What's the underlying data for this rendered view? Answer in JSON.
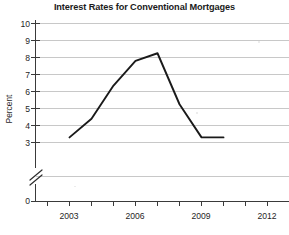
{
  "chart_data": {
    "type": "line",
    "title": "Interest Rates for Conventional Mortgages",
    "xlabel": "",
    "ylabel": "Percent",
    "x": [
      2003,
      2004,
      2005,
      2006,
      2007,
      2008,
      2009,
      2010
    ],
    "values": [
      3.3,
      4.4,
      6.35,
      7.8,
      8.25,
      5.25,
      3.3,
      3.3
    ],
    "series": [
      {
        "name": "Interest rate",
        "values": [
          3.3,
          4.4,
          6.35,
          7.8,
          8.25,
          5.25,
          3.3,
          3.3
        ]
      }
    ],
    "xlim": [
      2001.6,
      2012.8
    ],
    "ylim": [
      3,
      10
    ],
    "y_axis_break": true,
    "y_axis_break_between": [
      0,
      3
    ],
    "x_tick_labels": [
      "2003",
      "2006",
      "2009",
      "2012"
    ],
    "x_tick_values": [
      2003,
      2006,
      2009,
      2012
    ],
    "x_minor_tick_values": [
      2002,
      2003,
      2004,
      2005,
      2006,
      2007,
      2008,
      2009,
      2010,
      2011,
      2012
    ],
    "y_tick_labels": [
      "0",
      "3",
      "4",
      "5",
      "6",
      "7",
      "8",
      "9",
      "10"
    ],
    "y_tick_values": [
      0,
      3,
      4,
      5,
      6,
      7,
      8,
      9,
      10
    ],
    "grid": true,
    "grid_axis": "y",
    "legend": false,
    "legend_position": "none",
    "annotations": [],
    "colors": {
      "line": "#1a1a1a",
      "grid": "#c8c8c8",
      "axis": "#444444",
      "text": "#1b1b1b",
      "background": "#ffffff"
    }
  }
}
